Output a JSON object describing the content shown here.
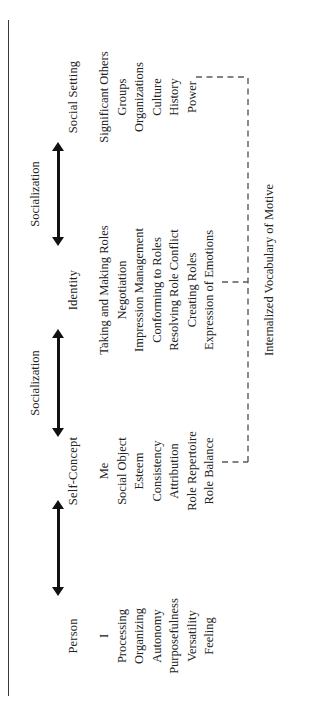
{
  "figure": {
    "orientation": "rotated-90-ccw",
    "columns": [
      {
        "title": "Person",
        "items": [
          "I",
          "Processing",
          "Organizing",
          "Autonomy",
          "Purposefulness",
          "Versatility",
          "Feeling"
        ]
      },
      {
        "title": "Self-Concept",
        "items": [
          "Me",
          "Social Object",
          "Esteem",
          "Consistency",
          "Attribution",
          "Role Repertoire",
          "Role Balance"
        ]
      },
      {
        "title": "Identity",
        "items": [
          "Taking and Making Roles",
          "Negotiation",
          "Impression Management",
          "Conforming to Roles",
          "Resolving Role Conflict",
          "Creating Roles",
          "Expression of Emotions"
        ]
      },
      {
        "title": "Social Setting",
        "items": [
          "Significant Others",
          "Groups",
          "Organizations",
          "Culture",
          "History",
          "Power"
        ]
      }
    ],
    "arrows": [
      {
        "label": "",
        "between": "Person ↔ Self-Concept"
      },
      {
        "label": "Socialization",
        "between": "Self-Concept ↔ Identity"
      },
      {
        "label": "Socialization",
        "between": "Identity ↔ Social Setting"
      }
    ],
    "bracket_label": "Internalized Vocabulary of Motive",
    "colors": {
      "text": "#222222",
      "arrow": "#111111",
      "bracket": "#5a5a5a",
      "rule": "#3a3a3a",
      "background": "#ffffff"
    }
  }
}
